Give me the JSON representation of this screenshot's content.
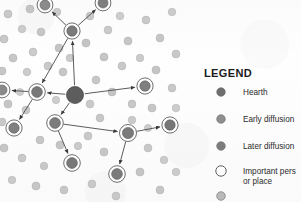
{
  "figure": {
    "type": "diffusion-network-map",
    "background_color": "#fefefe"
  },
  "legend": {
    "title": "LEGEND",
    "items": [
      {
        "label": "Hearth",
        "marker": "filled-dot-dark",
        "color": "#6e6e6e",
        "ring": false
      },
      {
        "label": "Early diffusion",
        "marker": "filled-dot-medium",
        "color": "#8f8f8f",
        "ring": false
      },
      {
        "label": "Later diffusion",
        "marker": "filled-dot-gray",
        "color": "#7d7d7d",
        "ring": false
      },
      {
        "label": "Important pers",
        "label_line2": "or place",
        "marker": "open-circle",
        "color": "#ffffff",
        "ring": true
      },
      {
        "label": "",
        "marker": "filled-dot-light",
        "color": "#b9b9b9",
        "ring": false
      }
    ]
  },
  "map": {
    "hearth": {
      "x": 75,
      "y": 95,
      "r": 8.5,
      "color": "#5d5d5d"
    },
    "network_nodes": [
      {
        "id": "n-up-left",
        "x": 45,
        "y": 5,
        "r": 5.0,
        "color": "#8a8a8a",
        "ring": true
      },
      {
        "id": "n-up-right",
        "x": 103,
        "y": 3,
        "r": 5.0,
        "color": "#7e7e7e",
        "ring": true
      },
      {
        "id": "n-upper-mid",
        "x": 72,
        "y": 31,
        "r": 5.2,
        "color": "#7a7a7a",
        "ring": true
      },
      {
        "id": "n-left-hub",
        "x": 37,
        "y": 92,
        "r": 5.4,
        "color": "#787878",
        "ring": true
      },
      {
        "id": "n-far-left",
        "x": 2,
        "y": 90,
        "r": 5.0,
        "color": "#8a8a8a",
        "ring": true
      },
      {
        "id": "n-lower-hub",
        "x": 55,
        "y": 123,
        "r": 5.4,
        "color": "#7c7c7c",
        "ring": true
      },
      {
        "id": "n-lower-left",
        "x": 14,
        "y": 128,
        "r": 5.2,
        "color": "#808080",
        "ring": true
      },
      {
        "id": "n-lower-mid",
        "x": 72,
        "y": 163,
        "r": 5.4,
        "color": "#787878",
        "ring": true
      },
      {
        "id": "n-right-hub",
        "x": 128,
        "y": 133,
        "r": 5.6,
        "color": "#7a7a7a",
        "ring": true
      },
      {
        "id": "n-right-far",
        "x": 170,
        "y": 125,
        "r": 5.2,
        "color": "#777777",
        "ring": true
      },
      {
        "id": "n-right-low",
        "x": 117,
        "y": 174,
        "r": 5.4,
        "color": "#7b7b7b",
        "ring": true
      },
      {
        "id": "n-right-top",
        "x": 145,
        "y": 86,
        "r": 5.2,
        "color": "#7f7f7f",
        "ring": true
      }
    ],
    "arrows": [
      {
        "from": "hearth",
        "to": "n-left-hub"
      },
      {
        "from": "hearth",
        "to": "n-upper-mid"
      },
      {
        "from": "hearth",
        "to": "n-right-top"
      },
      {
        "from": "hearth",
        "to": "n-lower-hub"
      },
      {
        "from": "n-upper-mid",
        "to": "n-up-left"
      },
      {
        "from": "n-upper-mid",
        "to": "n-up-right"
      },
      {
        "from": "n-upper-mid",
        "to": "n-left-hub"
      },
      {
        "from": "n-left-hub",
        "to": "n-far-left"
      },
      {
        "from": "n-left-hub",
        "to": "n-lower-left"
      },
      {
        "from": "n-lower-hub",
        "to": "n-lower-mid"
      },
      {
        "from": "n-lower-hub",
        "to": "n-right-hub"
      },
      {
        "from": "n-right-hub",
        "to": "n-right-far"
      },
      {
        "from": "n-right-hub",
        "to": "n-right-low"
      }
    ],
    "scatter_dots": [
      {
        "x": 8,
        "y": 14,
        "r": 4.0,
        "c": "#c9c9c9"
      },
      {
        "x": 30,
        "y": 9,
        "r": 4.0,
        "c": "#c4c4c4"
      },
      {
        "x": 22,
        "y": 29,
        "r": 3.8,
        "c": "#cccccc"
      },
      {
        "x": 4,
        "y": 39,
        "r": 4.0,
        "c": "#c8c8c8"
      },
      {
        "x": 41,
        "y": 32,
        "r": 3.9,
        "c": "#c6c6c6"
      },
      {
        "x": 57,
        "y": 12,
        "r": 3.8,
        "c": "#cacaca"
      },
      {
        "x": 59,
        "y": 48,
        "r": 4.0,
        "c": "#c5c5c5"
      },
      {
        "x": 33,
        "y": 52,
        "r": 3.9,
        "c": "#cbcbcb"
      },
      {
        "x": 13,
        "y": 58,
        "r": 4.0,
        "c": "#c7c7c7"
      },
      {
        "x": 48,
        "y": 66,
        "r": 3.9,
        "c": "#c9c9c9"
      },
      {
        "x": 2,
        "y": 71,
        "r": 4.0,
        "c": "#c6c6c6"
      },
      {
        "x": 27,
        "y": 72,
        "r": 3.8,
        "c": "#cccccc"
      },
      {
        "x": 63,
        "y": 72,
        "r": 3.9,
        "c": "#c7c7c7"
      },
      {
        "x": 90,
        "y": 16,
        "r": 3.9,
        "c": "#c8c8c8"
      },
      {
        "x": 86,
        "y": 43,
        "r": 4.0,
        "c": "#c4c4c4"
      },
      {
        "x": 108,
        "y": 30,
        "r": 3.9,
        "c": "#cacaca"
      },
      {
        "x": 120,
        "y": 16,
        "r": 3.8,
        "c": "#cdcdcd"
      },
      {
        "x": 128,
        "y": 41,
        "r": 4.0,
        "c": "#c6c6c6"
      },
      {
        "x": 146,
        "y": 20,
        "r": 3.9,
        "c": "#c9c9c9"
      },
      {
        "x": 160,
        "y": 38,
        "r": 3.9,
        "c": "#c5c5c5"
      },
      {
        "x": 172,
        "y": 12,
        "r": 3.8,
        "c": "#cbcbcb"
      },
      {
        "x": 176,
        "y": 54,
        "r": 3.9,
        "c": "#c8c8c8"
      },
      {
        "x": 104,
        "y": 57,
        "r": 4.0,
        "c": "#c6c6c6"
      },
      {
        "x": 122,
        "y": 66,
        "r": 3.9,
        "c": "#c9c9c9"
      },
      {
        "x": 140,
        "y": 58,
        "r": 3.8,
        "c": "#cacaca"
      },
      {
        "x": 156,
        "y": 70,
        "r": 4.0,
        "c": "#c5c5c5"
      },
      {
        "x": 172,
        "y": 88,
        "r": 3.9,
        "c": "#c8c8c8"
      },
      {
        "x": 96,
        "y": 80,
        "r": 3.9,
        "c": "#c7c7c7"
      },
      {
        "x": 112,
        "y": 92,
        "r": 4.0,
        "c": "#c4c4c4"
      },
      {
        "x": 90,
        "y": 104,
        "r": 3.9,
        "c": "#cacaca"
      },
      {
        "x": 132,
        "y": 104,
        "r": 3.9,
        "c": "#c8c8c8"
      },
      {
        "x": 152,
        "y": 108,
        "r": 4.0,
        "c": "#c6c6c6"
      },
      {
        "x": 176,
        "y": 108,
        "r": 3.8,
        "c": "#cccccc"
      },
      {
        "x": 8,
        "y": 104,
        "r": 4.0,
        "c": "#c5c5c5"
      },
      {
        "x": 26,
        "y": 110,
        "r": 3.9,
        "c": "#c9c9c9"
      },
      {
        "x": 40,
        "y": 140,
        "r": 3.9,
        "c": "#c7c7c7"
      },
      {
        "x": 4,
        "y": 148,
        "r": 4.0,
        "c": "#c6c6c6"
      },
      {
        "x": 22,
        "y": 158,
        "r": 3.9,
        "c": "#cacaca"
      },
      {
        "x": 44,
        "y": 166,
        "r": 3.8,
        "c": "#c8c8c8"
      },
      {
        "x": 60,
        "y": 145,
        "r": 4.0,
        "c": "#c5c5c5"
      },
      {
        "x": 88,
        "y": 136,
        "r": 3.9,
        "c": "#c9c9c9"
      },
      {
        "x": 100,
        "y": 118,
        "r": 3.9,
        "c": "#c7c7c7"
      },
      {
        "x": 104,
        "y": 152,
        "r": 4.0,
        "c": "#c6c6c6"
      },
      {
        "x": 148,
        "y": 148,
        "r": 3.9,
        "c": "#c8c8c8"
      },
      {
        "x": 164,
        "y": 160,
        "r": 3.8,
        "c": "#cbcbcb"
      },
      {
        "x": 140,
        "y": 172,
        "r": 4.0,
        "c": "#c5c5c5"
      },
      {
        "x": 92,
        "y": 184,
        "r": 3.9,
        "c": "#c9c9c9"
      },
      {
        "x": 64,
        "y": 190,
        "r": 3.9,
        "c": "#c7c7c7"
      },
      {
        "x": 36,
        "y": 186,
        "r": 4.0,
        "c": "#c6c6c6"
      },
      {
        "x": 12,
        "y": 180,
        "r": 3.8,
        "c": "#cacaca"
      },
      {
        "x": 116,
        "y": 196,
        "r": 3.9,
        "c": "#c8c8c8"
      },
      {
        "x": 160,
        "y": 190,
        "r": 3.9,
        "c": "#c5c5c5"
      },
      {
        "x": 176,
        "y": 172,
        "r": 3.8,
        "c": "#cccccc"
      },
      {
        "x": 2,
        "y": 122,
        "r": 3.9,
        "c": "#c8c8c8"
      },
      {
        "x": 70,
        "y": 58,
        "r": 3.8,
        "c": "#cbcbcb"
      },
      {
        "x": 132,
        "y": 120,
        "r": 3.8,
        "c": "#cacaca"
      },
      {
        "x": 56,
        "y": 100,
        "r": 3.7,
        "c": "#cdcdcd"
      },
      {
        "x": 148,
        "y": 128,
        "r": 3.6,
        "c": "#cccccc"
      },
      {
        "x": 78,
        "y": 146,
        "r": 3.7,
        "c": "#cbcbcb"
      },
      {
        "x": 20,
        "y": 92,
        "r": 3.6,
        "c": "#cecece"
      }
    ]
  }
}
